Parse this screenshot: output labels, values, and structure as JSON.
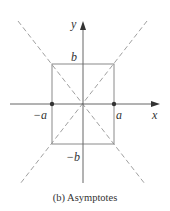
{
  "figure": {
    "caption": "(b) Asymptotes",
    "axes": {
      "x_label": "x",
      "y_label": "y"
    },
    "labels": {
      "b": "b",
      "neg_b": "−b",
      "a": "a",
      "neg_a": "−a"
    },
    "elements": {
      "rectangle": "central rectangle with vertices (±a, ±b)",
      "asymptotes": "dashed lines y = ±(b/a)x through opposite rectangle corners",
      "points": [
        "(-a, 0)",
        "(a, 0)"
      ]
    },
    "colors": {
      "line": "#8a8a8a",
      "axis": "#555555",
      "dashed": "#a0a0a0",
      "point": "#333333"
    }
  }
}
